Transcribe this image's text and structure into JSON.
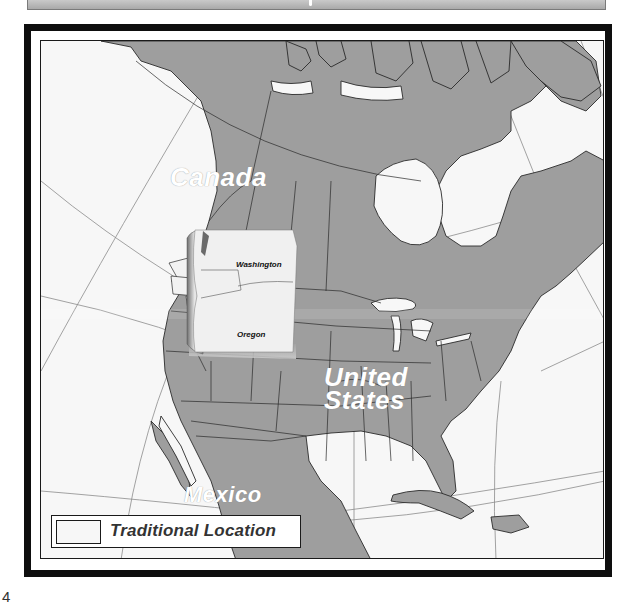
{
  "page": {
    "page_number": "4"
  },
  "map": {
    "title_bar_text": "",
    "colors": {
      "land": "#9e9e9e",
      "water": "#f7f7f7",
      "border_line": "#2a2a2a",
      "graticule": "#8c8c8c",
      "frame": "#0e0e0e",
      "traditional_location": "#f2f2f2"
    },
    "country_labels": [
      {
        "name": "Canada"
      },
      {
        "name": "United"
      },
      {
        "name": "States"
      },
      {
        "name": "Mexico"
      }
    ],
    "inset": {
      "states": [
        {
          "name": "Washington"
        },
        {
          "name": "Oregon"
        }
      ]
    },
    "legend": {
      "items": [
        {
          "label": "Traditional Location",
          "swatch_color": "#f2f2f2"
        }
      ]
    }
  }
}
